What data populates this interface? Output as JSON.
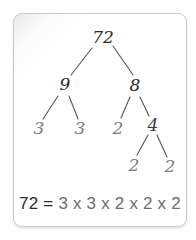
{
  "diagram": {
    "type": "factor-tree",
    "root": "72",
    "nodes": [
      {
        "id": "n72",
        "label": "72",
        "x": 103,
        "y": 38,
        "color": "#2a2a2a"
      },
      {
        "id": "n9",
        "label": "9",
        "x": 65,
        "y": 85,
        "color": "#2a2a2a"
      },
      {
        "id": "n8",
        "label": "8",
        "x": 135,
        "y": 86,
        "color": "#2a2a2a"
      },
      {
        "id": "n3a",
        "label": "3",
        "x": 39,
        "y": 129,
        "color": "#7a7a7a"
      },
      {
        "id": "n3b",
        "label": "3",
        "x": 80,
        "y": 129,
        "color": "#7a7a7a"
      },
      {
        "id": "n2a",
        "label": "2",
        "x": 118,
        "y": 129,
        "color": "#7a7a7a"
      },
      {
        "id": "n4",
        "label": "4",
        "x": 153,
        "y": 126,
        "color": "#3a3a3a"
      },
      {
        "id": "n2b",
        "label": "2",
        "x": 134,
        "y": 166,
        "color": "#7a7a7a"
      },
      {
        "id": "n2c",
        "label": "2",
        "x": 170,
        "y": 167,
        "color": "#7a7a7a"
      }
    ],
    "edges": [
      {
        "from": "n72",
        "to": "n9",
        "x1": 92,
        "y1": 48,
        "x2": 71,
        "y2": 75
      },
      {
        "from": "n72",
        "to": "n8",
        "x1": 113,
        "y1": 46,
        "x2": 133,
        "y2": 75
      },
      {
        "from": "n9",
        "to": "n3a",
        "x1": 58,
        "y1": 96,
        "x2": 43,
        "y2": 119
      },
      {
        "from": "n9",
        "to": "n3b",
        "x1": 69,
        "y1": 96,
        "x2": 78,
        "y2": 119
      },
      {
        "from": "n8",
        "to": "n2a",
        "x1": 130,
        "y1": 97,
        "x2": 121,
        "y2": 118
      },
      {
        "from": "n8",
        "to": "n4",
        "x1": 140,
        "y1": 97,
        "x2": 149,
        "y2": 116
      },
      {
        "from": "n4",
        "to": "n2b",
        "x1": 148,
        "y1": 135,
        "x2": 137,
        "y2": 155
      },
      {
        "from": "n4",
        "to": "n2c",
        "x1": 157,
        "y1": 135,
        "x2": 167,
        "y2": 157
      }
    ],
    "line_color": "#555555"
  },
  "equation": {
    "lhs": "72 =",
    "rhs": " 3 x 3 x 2 x 2 x 2",
    "full": "72 = 3 x 3 x 2 x 2 x 2"
  }
}
